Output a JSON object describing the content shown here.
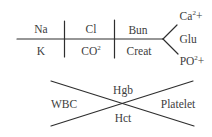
{
  "bmp_fishbone": {
    "top": {
      "na": "Na",
      "cl": "Cl",
      "bun": "Bun"
    },
    "bottom": {
      "k": "K",
      "co2_base": "CO",
      "co2_sup": "2",
      "creat": "Creat"
    },
    "branch": {
      "ca_base": "Ca",
      "ca_sup": "2",
      "ca_suffix": "+",
      "glu": "Glu",
      "po_base": "PO",
      "po_sup": "2",
      "po_suffix": "+"
    }
  },
  "cbc_cross": {
    "left": "WBC",
    "top": "Hgb",
    "bottom": "Hct",
    "right": "Platelet"
  },
  "colors": {
    "line": "#2e2e2e",
    "text": "#3d3d3d",
    "background": "#ffffff"
  }
}
